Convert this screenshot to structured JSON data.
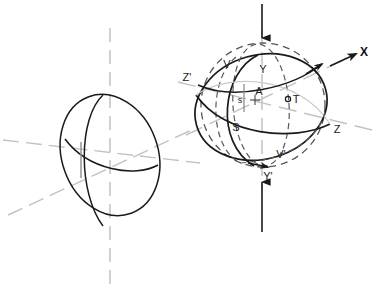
{
  "figure": {
    "background_color": "#ffffff",
    "stroke_color": "#1a1a1a",
    "guide_color": "#b9b9b9",
    "dash_color": "#5a5a5a"
  },
  "axes": {
    "x_label": "X",
    "z_label": "Z",
    "z_prime_label": "Z'",
    "y_label": "Y",
    "y_prime_label": "Y'"
  },
  "labels": {
    "v": "V",
    "v_prime": "V'",
    "y": "Y",
    "y_prime": "Y'",
    "z": "Z",
    "z_prime": "Z'",
    "a": "A",
    "s_lower": "s",
    "s_upper": "S",
    "t": "T",
    "x": "X"
  },
  "left_sphere": {
    "name": "left-sphere",
    "center_x": 110,
    "center_y": 155,
    "radius_x": 48,
    "radius_y": 62,
    "rotation_deg": -20,
    "has_labels": false
  },
  "right_sphere": {
    "name": "right-sphere",
    "center_x": 263,
    "center_y": 105,
    "radius": 62,
    "tilt_deg": -22
  },
  "arrows": {
    "top_arrow_direction": "down",
    "bottom_arrow_direction": "up",
    "x_axis_arrow_direction": "up-right"
  },
  "points": {
    "t_marker": "circle",
    "a_marker": "none",
    "s_marker": "none"
  }
}
